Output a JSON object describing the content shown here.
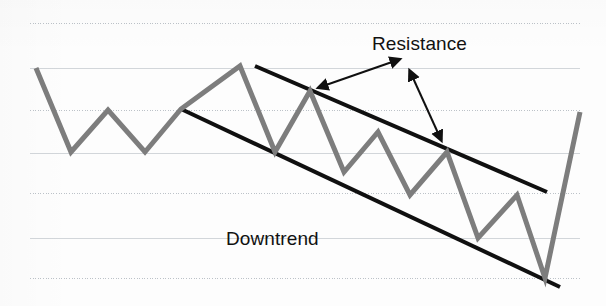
{
  "chart_data": {
    "type": "line",
    "title": "",
    "subtitle": "",
    "xlabel": "",
    "ylabel": "",
    "grid": true,
    "legend_position": "none",
    "xlim": [
      0,
      606
    ],
    "ylim": [
      306,
      0
    ],
    "axis_note": "Unlabeled technical-analysis schematic; axes have no tick values, only horizontal ruled gridlines.",
    "gridlines_y": [
      23,
      68,
      110,
      153,
      193,
      238,
      278
    ],
    "gridline_x_extent": [
      30,
      580
    ],
    "series": [
      {
        "name": "Price",
        "color": "#7d7d7d",
        "width": 5,
        "points": [
          [
            36,
            68
          ],
          [
            71,
            152
          ],
          [
            108,
            110
          ],
          [
            145,
            152
          ],
          [
            181,
            109
          ],
          [
            240,
            66
          ],
          [
            275,
            152
          ],
          [
            310,
            91
          ],
          [
            344,
            172
          ],
          [
            378,
            132
          ],
          [
            410,
            195
          ],
          [
            447,
            152
          ],
          [
            478,
            238
          ],
          [
            517,
            195
          ],
          [
            545,
            278
          ],
          [
            580,
            112
          ]
        ]
      }
    ],
    "trendlines": [
      {
        "name": "Resistance",
        "role": "upper-boundary",
        "color": "#101010",
        "width": 4,
        "from": [
          255,
          66
        ],
        "to": [
          547,
          192
        ]
      },
      {
        "name": "Downtrend",
        "role": "lower-boundary",
        "color": "#101010",
        "width": 4,
        "from": [
          181,
          109
        ],
        "to": [
          560,
          287
        ]
      }
    ],
    "annotations": [
      {
        "id": "resistance-label",
        "text": "Resistance",
        "x": 372,
        "y": 50,
        "anchor": "start",
        "font_size": 19,
        "color": "#111111"
      },
      {
        "id": "downtrend-label",
        "text": "Downtrend",
        "x": 226,
        "y": 245,
        "anchor": "start",
        "font_size": 19,
        "color": "#111111"
      },
      {
        "id": "resistance-arrow",
        "type": "double-headed-arrow",
        "from": [
          326,
          85
        ],
        "to": [
          392,
          62
        ],
        "color": "#101010",
        "width": 2
      },
      {
        "id": "channel-arrow",
        "type": "double-headed-arrow",
        "from": [
          413,
          78
        ],
        "to": [
          438,
          133
        ],
        "color": "#101010",
        "width": 2
      }
    ],
    "colors": {
      "background": "#fdfdfd",
      "gridline": "#b9bfc6",
      "price_line": "#7d7d7d",
      "trendline": "#101010",
      "annotation_text": "#111111",
      "arrow": "#101010"
    },
    "pattern": "Descending channel / downtrend with resistance boundary and breakout at right edge"
  }
}
